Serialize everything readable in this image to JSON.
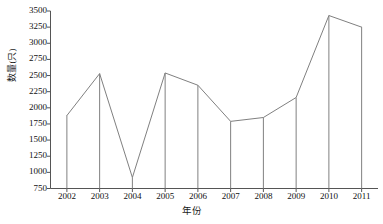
{
  "chart_data": {
    "type": "line",
    "title": "",
    "subtitle": "",
    "xlabel": "年份",
    "ylabel": "数量(只)",
    "categories": [
      "2002",
      "2003",
      "2004",
      "2005",
      "2006",
      "2007",
      "2008",
      "2009",
      "2010",
      "2011"
    ],
    "values": [
      1880,
      2530,
      920,
      2540,
      2350,
      1790,
      1850,
      2160,
      3430,
      3250
    ],
    "series": [
      {
        "name": "数量(只)",
        "values": [
          1880,
          2530,
          920,
          2540,
          2350,
          1790,
          1850,
          2160,
          3430,
          3250
        ]
      }
    ],
    "ylim": [
      750,
      3500
    ],
    "ytick_labels": [
      "750",
      "1000",
      "1250",
      "1500",
      "1750",
      "2000",
      "2250",
      "2500",
      "2750",
      "3000",
      "3250",
      "3500"
    ],
    "ytick_values": [
      750,
      1000,
      1250,
      1500,
      1750,
      2000,
      2250,
      2500,
      2750,
      3000,
      3250,
      3500
    ],
    "xtick_labels": [
      "2002",
      "2003",
      "2004",
      "2005",
      "2006",
      "2007",
      "2008",
      "2009",
      "2010",
      "2011"
    ],
    "grid": false,
    "legend": "none",
    "drop_lines": true,
    "line_color": "#808080",
    "axis_color": "#555555",
    "background_color": "#ffffff"
  }
}
